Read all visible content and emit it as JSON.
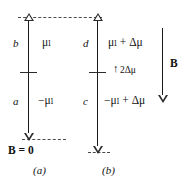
{
  "figure": {
    "caption_a": "(a)",
    "caption_b": "(b)",
    "panel_a": {
      "node_top": "b",
      "node_bottom": "a",
      "level_top": "μₗ",
      "level_bottom": "−μₗ",
      "field_note": "B = 0"
    },
    "panel_b": {
      "node_top": "d",
      "node_bottom": "c",
      "level_top": "μₗ + Δμ",
      "level_bottom": "−μₗ + Δμ",
      "gap_arrow": "↑",
      "gap_label": "2Δμ"
    },
    "field_arrow_label": "B",
    "colors": {
      "line": "#1a1a1a",
      "dash": "#4a4a4a",
      "text": "#111111",
      "background": "#ffffff"
    }
  }
}
